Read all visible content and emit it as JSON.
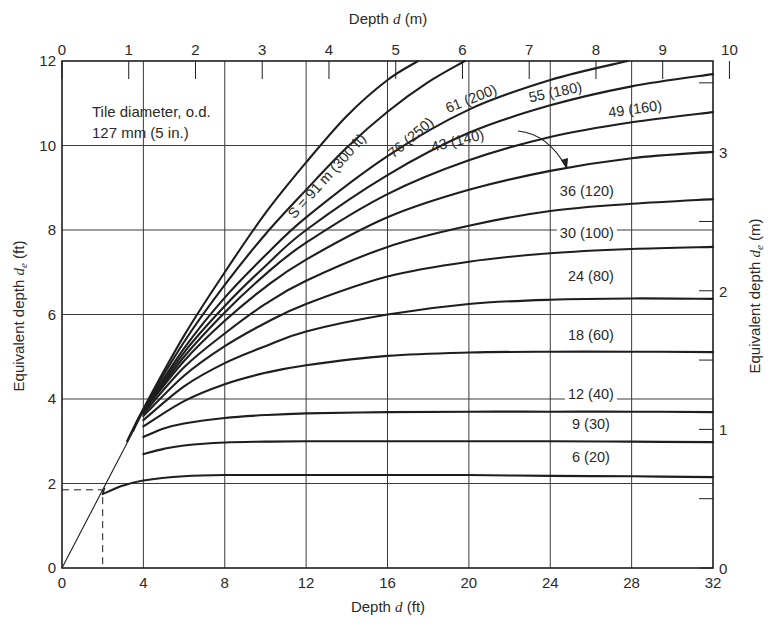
{
  "chart_data": {
    "type": "line",
    "title": "",
    "annotation": [
      "Tile diameter, o.d.",
      "127 mm (5 in.)"
    ],
    "xlabel": "Depth d (ft)",
    "x2label": "Depth d (m)",
    "ylabel": "Equivalent depth d_e (ft)",
    "y2label": "Equivalent depth d_e (m)",
    "xlim": [
      0,
      32
    ],
    "ylim": [
      0,
      12
    ],
    "x_ticks": [
      0,
      4,
      8,
      12,
      16,
      20,
      24,
      28,
      32
    ],
    "y_ticks": [
      0,
      2,
      4,
      6,
      8,
      10,
      12
    ],
    "x2_ticks_m": [
      0,
      1,
      2,
      3,
      4,
      5,
      6,
      7,
      8,
      9,
      10
    ],
    "y2_ticks_m": [
      0,
      1,
      2,
      3
    ],
    "grid": true,
    "legend": "inline curve labels",
    "reference_line": {
      "name": "d_e = d",
      "x": [
        0,
        4.0
      ],
      "y": [
        0,
        3.7
      ]
    },
    "example_dashed": {
      "d": 2.0,
      "de": 1.85
    },
    "series": [
      {
        "name": "6 (20)",
        "spacing_m": 6,
        "spacing_ft": 20,
        "x": [
          2,
          3,
          4,
          6,
          8,
          12,
          16,
          20,
          24,
          28,
          32
        ],
        "y": [
          1.75,
          1.95,
          2.07,
          2.17,
          2.2,
          2.2,
          2.2,
          2.2,
          2.18,
          2.17,
          2.15
        ]
      },
      {
        "name": "9 (30)",
        "spacing_m": 9,
        "spacing_ft": 30,
        "x": [
          4,
          5,
          6,
          8,
          10,
          12,
          16,
          20,
          24,
          28,
          32
        ],
        "y": [
          2.7,
          2.82,
          2.9,
          2.97,
          2.99,
          3.0,
          3.0,
          3.0,
          3.0,
          2.99,
          2.98
        ]
      },
      {
        "name": "12 (40)",
        "spacing_m": 12,
        "spacing_ft": 40,
        "x": [
          4,
          5,
          6,
          8,
          10,
          12,
          16,
          20,
          24,
          28,
          32
        ],
        "y": [
          3.1,
          3.3,
          3.42,
          3.55,
          3.62,
          3.66,
          3.69,
          3.7,
          3.7,
          3.7,
          3.69
        ]
      },
      {
        "name": "18 (60)",
        "spacing_m": 18,
        "spacing_ft": 60,
        "x": [
          4,
          6,
          8,
          10,
          12,
          16,
          20,
          24,
          28,
          32
        ],
        "y": [
          3.35,
          3.95,
          4.35,
          4.62,
          4.8,
          5.02,
          5.1,
          5.12,
          5.12,
          5.11
        ]
      },
      {
        "name": "24 (80)",
        "spacing_m": 24,
        "spacing_ft": 80,
        "x": [
          4,
          6,
          8,
          10,
          12,
          16,
          20,
          24,
          28,
          32
        ],
        "y": [
          3.5,
          4.3,
          4.85,
          5.25,
          5.6,
          6.0,
          6.25,
          6.35,
          6.38,
          6.37
        ]
      },
      {
        "name": "30 (100)",
        "spacing_m": 30,
        "spacing_ft": 100,
        "x": [
          4,
          6,
          8,
          10,
          12,
          16,
          20,
          24,
          28,
          32
        ],
        "y": [
          3.6,
          4.55,
          5.25,
          5.8,
          6.25,
          6.9,
          7.25,
          7.45,
          7.55,
          7.6
        ]
      },
      {
        "name": "36 (120)",
        "spacing_m": 36,
        "spacing_ft": 120,
        "x": [
          4,
          6,
          8,
          10,
          12,
          16,
          20,
          24,
          28,
          32
        ],
        "y": [
          3.65,
          4.75,
          5.55,
          6.25,
          6.8,
          7.6,
          8.1,
          8.45,
          8.62,
          8.73
        ]
      },
      {
        "name": "43 (140)",
        "spacing_m": 43,
        "spacing_ft": 140,
        "x": [
          4,
          6,
          8,
          10,
          12,
          16,
          20,
          24,
          28,
          32
        ],
        "y": [
          3.7,
          4.9,
          5.85,
          6.65,
          7.3,
          8.3,
          8.95,
          9.4,
          9.7,
          9.85
        ]
      },
      {
        "name": "49 (160)",
        "spacing_m": 49,
        "spacing_ft": 160,
        "x": [
          4,
          6,
          8,
          10,
          12,
          16,
          20,
          24,
          28,
          32
        ],
        "y": [
          3.72,
          5.0,
          6.05,
          6.95,
          7.7,
          8.85,
          9.65,
          10.2,
          10.55,
          10.79
        ]
      },
      {
        "name": "55 (180)",
        "spacing_m": 55,
        "spacing_ft": 180,
        "x": [
          4,
          6,
          8,
          10,
          12,
          16,
          20,
          24,
          28,
          32
        ],
        "y": [
          3.73,
          5.1,
          6.2,
          7.15,
          8.0,
          9.3,
          10.3,
          10.95,
          11.4,
          11.69
        ]
      },
      {
        "name": "61 (200)",
        "spacing_m": 61,
        "spacing_ft": 200,
        "x": [
          4,
          6,
          8,
          10,
          12,
          16,
          20,
          24,
          27.8
        ],
        "y": [
          3.74,
          5.2,
          6.4,
          7.4,
          8.3,
          9.75,
          10.85,
          11.55,
          12.0
        ]
      },
      {
        "name": "76 (250)",
        "spacing_m": 76,
        "spacing_ft": 250,
        "x": [
          3.5,
          4,
          6,
          8,
          10,
          12,
          14,
          16,
          18,
          19.8
        ],
        "y": [
          3.25,
          3.75,
          5.35,
          6.7,
          7.9,
          8.95,
          9.95,
          10.8,
          11.5,
          12.0
        ]
      },
      {
        "name": "S = 91 m (300 ft)",
        "spacing_m": 91,
        "spacing_ft": 300,
        "x": [
          3.2,
          4,
          6,
          8,
          10,
          12,
          14,
          16,
          17.5
        ],
        "y": [
          3.0,
          3.77,
          5.5,
          7.0,
          8.4,
          9.6,
          10.7,
          11.55,
          12.0
        ]
      }
    ],
    "label_positions": [
      {
        "text": "6 (20)",
        "x": 26,
        "y": 2.5,
        "rotate": 0
      },
      {
        "text": "9 (30)",
        "x": 26,
        "y": 3.3,
        "rotate": 0
      },
      {
        "text": "12 (40)",
        "x": 26,
        "y": 4.0,
        "rotate": 0
      },
      {
        "text": "18 (60)",
        "x": 26,
        "y": 5.4,
        "rotate": 0
      },
      {
        "text": "24 (80)",
        "x": 26,
        "y": 6.8,
        "rotate": 0
      },
      {
        "text": "30 (100)",
        "x": 25.8,
        "y": 7.8,
        "rotate": 0
      },
      {
        "text": "36 (120)",
        "x": 25.8,
        "y": 8.8,
        "rotate": 0
      },
      {
        "text": "43 (140)",
        "x": 19.5,
        "y": 10.0,
        "rotate": -14
      },
      {
        "text": "49 (160)",
        "x": 28.2,
        "y": 10.75,
        "rotate": -8
      },
      {
        "text": "55 (180)",
        "x": 24.3,
        "y": 11.15,
        "rotate": -12
      },
      {
        "text": "61 (200)",
        "x": 20.2,
        "y": 11.0,
        "rotate": -22
      },
      {
        "text": "76 (250)",
        "x": 17.3,
        "y": 10.1,
        "rotate": -40
      },
      {
        "text": "S = 91 m (300 ft)",
        "x": 13.2,
        "y": 9.2,
        "rotate": -48
      }
    ]
  },
  "labels": {
    "note_line1": "Tile diameter, o.d.",
    "note_line2": "127 mm (5 in.)",
    "x_axis_title_prefix": "Depth ",
    "x_axis_title_var": "d",
    "x_axis_title_unit": " (ft)",
    "x2_axis_title_prefix": "Depth ",
    "x2_axis_title_var": "d",
    "x2_axis_title_unit": " (m)",
    "y_axis_title_prefix": "Equivalent depth ",
    "y_axis_title_var": "d",
    "y_axis_title_sub": "e",
    "y_axis_title_unit": " (ft)",
    "y2_axis_title_prefix": "Equivalent depth ",
    "y2_axis_title_var": "d",
    "y2_axis_title_sub": "e",
    "y2_axis_title_unit": " (m)"
  },
  "colors": {
    "line": "#1e1e1e",
    "grid": "#3a3a3a",
    "background": "#ffffff"
  }
}
